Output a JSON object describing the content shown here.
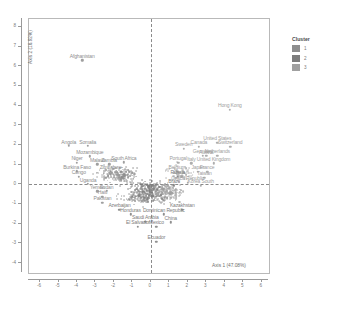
{
  "chart_data": {
    "type": "scatter",
    "title": "",
    "xlabel": "Axis 1 (47.08%)",
    "ylabel": "Axis 2 (16.92%)",
    "xlim": [
      -6.6,
      6.4
    ],
    "ylim": [
      -4.5,
      8.4
    ],
    "xticks": [
      -6,
      -5,
      -4,
      -3,
      -2,
      -1,
      0,
      1,
      2,
      3,
      4,
      5,
      6
    ],
    "yticks": [
      -4,
      -3,
      -2,
      -1,
      0,
      1,
      2,
      3,
      4,
      5,
      6,
      7,
      8
    ],
    "xtick_labels": [
      "-6",
      "-5",
      "-4",
      "-3",
      "-2",
      "-1",
      "0",
      "1",
      "2",
      "3",
      "4",
      "5",
      "6"
    ],
    "ytick_labels": [
      "-4",
      "-3",
      "-2",
      "-1",
      "0",
      "1",
      "2",
      "3",
      "4",
      "5",
      "6",
      "7",
      "8"
    ],
    "grid": false,
    "reference_lines": {
      "vertical_x": 0,
      "horizontal_y": 0,
      "style": "dashed"
    },
    "legend": {
      "title": "Cluster",
      "position": "right",
      "entries": [
        {
          "label": "1",
          "color": "#8e8e8e"
        },
        {
          "label": "2",
          "color": "#7d7d7d"
        },
        {
          "label": "3",
          "color": "#a0a0a0"
        }
      ]
    },
    "labeled_points": [
      {
        "label": "Afghanistan",
        "x": -3.72,
        "y": 6.3,
        "cluster": 1
      },
      {
        "label": "Hong Kong",
        "x": 4.28,
        "y": 3.8,
        "cluster": 3
      },
      {
        "label": "Angola",
        "x": -4.45,
        "y": 1.95,
        "cluster": 1
      },
      {
        "label": "Somalia",
        "x": -3.42,
        "y": 1.95,
        "cluster": 1
      },
      {
        "label": "Mozambique",
        "x": -3.3,
        "y": 1.42,
        "cluster": 1
      },
      {
        "label": "Niger",
        "x": -4.0,
        "y": 1.1,
        "cluster": 1
      },
      {
        "label": "Malawi",
        "x": -2.9,
        "y": 1.02,
        "cluster": 1
      },
      {
        "label": "Zambia",
        "x": -2.26,
        "y": 1.02,
        "cluster": 1
      },
      {
        "label": "South Africa",
        "x": -1.46,
        "y": 1.12,
        "cluster": 1
      },
      {
        "label": "Burkina Faso",
        "x": -4.0,
        "y": 0.66,
        "cluster": 1
      },
      {
        "label": "Zimbabwe",
        "x": -2.18,
        "y": 0.63,
        "cluster": 1
      },
      {
        "label": "Congo",
        "x": -3.9,
        "y": 0.38,
        "cluster": 1
      },
      {
        "label": "Uganda",
        "x": -3.4,
        "y": 0.02,
        "cluster": 1
      },
      {
        "label": "Yemen",
        "x": -2.9,
        "y": -0.36,
        "cluster": 1
      },
      {
        "label": "Sudan",
        "x": -2.4,
        "y": -0.34,
        "cluster": 1
      },
      {
        "label": "Haiti",
        "x": -2.62,
        "y": -0.62,
        "cluster": 1
      },
      {
        "label": "Pakistan",
        "x": -2.62,
        "y": -0.94,
        "cluster": 1
      },
      {
        "label": "Azerbaijan",
        "x": -1.7,
        "y": -1.3,
        "cluster": 2
      },
      {
        "label": "Honduras",
        "x": -1.1,
        "y": -1.52,
        "cluster": 2
      },
      {
        "label": "Kazakhstan",
        "x": 1.7,
        "y": -1.28,
        "cluster": 2
      },
      {
        "label": "Dominican Republic",
        "x": 0.7,
        "y": -1.52,
        "cluster": 2
      },
      {
        "label": "Saudi Arabia",
        "x": -0.3,
        "y": -1.9,
        "cluster": 2
      },
      {
        "label": "China",
        "x": 1.08,
        "y": -1.92,
        "cluster": 2
      },
      {
        "label": "El Salvador",
        "x": -0.7,
        "y": -2.16,
        "cluster": 2
      },
      {
        "label": "Mexico",
        "x": 0.3,
        "y": -2.16,
        "cluster": 2
      },
      {
        "label": "Ecuador",
        "x": 0.3,
        "y": -2.92,
        "cluster": 2
      },
      {
        "label": "United States",
        "x": 3.6,
        "y": 2.12,
        "cluster": 3
      },
      {
        "label": "Switzerland",
        "x": 4.3,
        "y": 1.9,
        "cluster": 3
      },
      {
        "label": "Canada",
        "x": 2.6,
        "y": 1.92,
        "cluster": 3
      },
      {
        "label": "Sweden",
        "x": 1.78,
        "y": 1.8,
        "cluster": 3
      },
      {
        "label": "Germany",
        "x": 2.8,
        "y": 1.46,
        "cluster": 3
      },
      {
        "label": "Netherlands",
        "x": 3.6,
        "y": 1.46,
        "cluster": 3
      },
      {
        "label": "Austria",
        "x": 3.0,
        "y": 1.44,
        "cluster": 3
      },
      {
        "label": "Portugal",
        "x": 1.48,
        "y": 1.1,
        "cluster": 3
      },
      {
        "label": "United Kingdom",
        "x": 3.4,
        "y": 1.08,
        "cluster": 3
      },
      {
        "label": "Italy",
        "x": 2.2,
        "y": 1.08,
        "cluster": 3
      },
      {
        "label": "Belgium",
        "x": 1.42,
        "y": 0.66,
        "cluster": 3
      },
      {
        "label": "Japan",
        "x": 2.55,
        "y": 0.64,
        "cluster": 3
      },
      {
        "label": "France",
        "x": 3.05,
        "y": 0.64,
        "cluster": 3
      },
      {
        "label": "Russia",
        "x": 1.46,
        "y": 0.38,
        "cluster": 2
      },
      {
        "label": "Taiwan",
        "x": 2.9,
        "y": 0.34,
        "cluster": 3
      },
      {
        "label": "Czech Republic",
        "x": 2.0,
        "y": 0.08,
        "cluster": 3
      },
      {
        "label": "Brazil",
        "x": 1.26,
        "y": -0.04,
        "cluster": 2
      },
      {
        "label": "Korea South",
        "x": 2.7,
        "y": -0.06,
        "cluster": 3
      }
    ],
    "cloud_note": "dense unlabeled cluster of country points concentrated between x=-2 and x=2, y=-1 and y=1"
  }
}
